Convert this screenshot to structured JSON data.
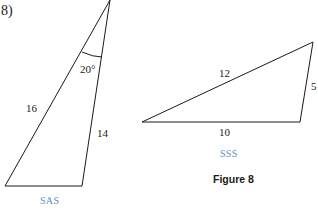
{
  "problem": {
    "number_label": "8)"
  },
  "triangle_sas": {
    "side_left": "16",
    "side_right": "14",
    "angle": "20°",
    "label": "SAS"
  },
  "triangle_sss": {
    "side_top": "12",
    "side_right": "5",
    "side_bottom": "10",
    "label": "SSS"
  },
  "caption": "Figure 8",
  "colors": {
    "line": "#1a1a1a",
    "label_accent": "#5b8fc9"
  }
}
